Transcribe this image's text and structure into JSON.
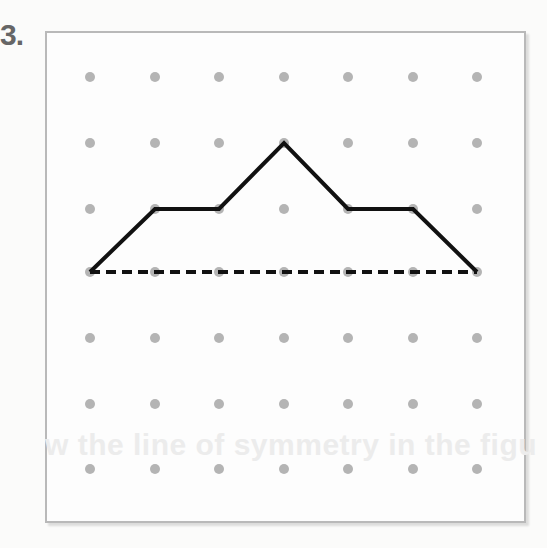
{
  "problem": {
    "number": "3."
  },
  "ghost_text": "w the line of symmetry in the figu",
  "grid": {
    "rows": 7,
    "cols": 7,
    "x": [
      90,
      155,
      219,
      284,
      348,
      413,
      477
    ],
    "y": [
      77,
      143,
      209,
      272,
      338,
      404,
      469
    ],
    "dot_color": "#b4b4b4"
  },
  "figure": {
    "type": "polyline",
    "stroke": "#111111",
    "points_grid": [
      [
        0,
        3
      ],
      [
        1,
        2
      ],
      [
        2,
        2
      ],
      [
        3,
        1
      ],
      [
        4,
        2
      ],
      [
        5,
        2
      ],
      [
        6,
        3
      ]
    ]
  },
  "symmetry_line": {
    "style": "dashed",
    "from_grid": [
      0,
      3
    ],
    "to_grid": [
      6,
      3
    ],
    "stroke": "#111111"
  }
}
